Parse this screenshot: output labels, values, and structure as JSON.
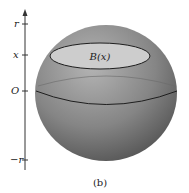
{
  "figure": {
    "caption": "(b)",
    "cross_section_label": "B(x)",
    "axis": {
      "ticks": [
        {
          "label": "r",
          "y": 24
        },
        {
          "label": "x",
          "y": 55
        },
        {
          "label": "O",
          "y": 91
        },
        {
          "label": "−r",
          "y": 160
        }
      ]
    },
    "colors": {
      "sphere_light": "#b8b8b8",
      "sphere_dark": "#5a5a5a",
      "disk_fill": "#c8c8c8",
      "line": "#1e1e1e"
    }
  }
}
